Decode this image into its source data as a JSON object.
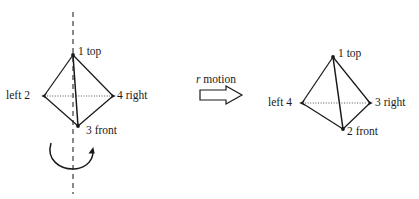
{
  "figure": {
    "background_color": "#ffffff",
    "stroke_color": "#1a1a1a",
    "left_object": {
      "name": "tetrahedron-before",
      "labels": {
        "top": "1 top",
        "left": "left 2",
        "right": "4 right",
        "front": "3 front"
      },
      "vertices": {
        "top": [
          73,
          55
        ],
        "left": [
          44,
          96
        ],
        "right": [
          113,
          96
        ],
        "front": [
          78,
          126
        ]
      },
      "hidden_edge": "left-right",
      "axis": {
        "name": "rotation-axis",
        "style": "dashed-vertical",
        "x": 73,
        "y_start": 12,
        "y_end": 194
      },
      "rotation_arrow": {
        "name": "rotation-curved-arrow",
        "direction": "counterclockwise-about-vertical-axis"
      }
    },
    "transform": {
      "label": "r motion",
      "label_italic_part": "r",
      "label_rest": " motion",
      "arrow": "block-arrow-right-hollow"
    },
    "right_object": {
      "name": "tetrahedron-after",
      "labels": {
        "top": "1 top",
        "left": "left 4",
        "right": "3 right",
        "front": "2 front"
      },
      "vertices": {
        "top": [
          333,
          57
        ],
        "left": [
          302,
          103
        ],
        "right": [
          370,
          103
        ],
        "front": [
          343,
          129
        ]
      },
      "hidden_edge": "left-right"
    }
  }
}
